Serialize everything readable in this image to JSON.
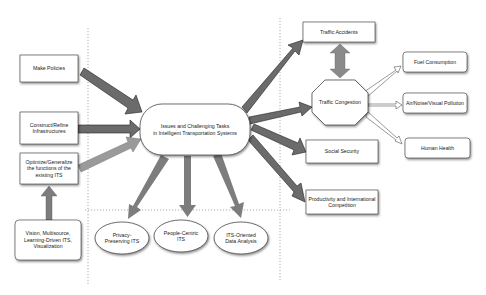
{
  "diagram": {
    "central": {
      "label": "Issues and Challenging Tasks\nin Intelligent Transportation Systems",
      "line1": "Issues and Challenging Tasks",
      "line2": "in Intelligent Transportation Systems"
    },
    "left_boxes": [
      {
        "id": "make-policies",
        "label": "Make Policies"
      },
      {
        "id": "construct-refine",
        "line1": "Construct/Refine",
        "line2": "Infrastructures"
      },
      {
        "id": "optimize-generalize",
        "line1": "Optimize/Generalize",
        "line2": "the functions of the",
        "line3": "existing ITS"
      },
      {
        "id": "vision",
        "line1": "Vision, Multisource,",
        "line2": "Learning-Driven ITS,",
        "line3": "Visualization"
      }
    ],
    "bottom_ellipses": [
      {
        "id": "privacy",
        "line1": "Privacy-",
        "line2": "Preserving ITS"
      },
      {
        "id": "people-centric",
        "line1": "People-Centric",
        "line2": "ITS"
      },
      {
        "id": "its-oriented",
        "line1": "ITS-Oriented",
        "line2": "Data Analysis"
      }
    ],
    "right_boxes": [
      {
        "id": "traffic-accidents",
        "label": "Traffic Accidents"
      },
      {
        "id": "social-security",
        "label": "Social Security"
      },
      {
        "id": "productivity",
        "line1": "Productivity and International",
        "line2": "Competition"
      }
    ],
    "octagon": {
      "label": "Traffic Congestion"
    },
    "far_right_boxes": [
      {
        "id": "fuel",
        "label": "Fuel Consumption"
      },
      {
        "id": "pollution",
        "label": "Air/Noise/Visual Pollution"
      },
      {
        "id": "health",
        "label": "Human Health"
      }
    ],
    "colors": {
      "arrow_dark": "#6b6b6b",
      "arrow_light": "#9a9a9a",
      "arrow_mid": "#7d7d7d",
      "outline": "#333333",
      "dotted": "#9a9a9a"
    }
  }
}
